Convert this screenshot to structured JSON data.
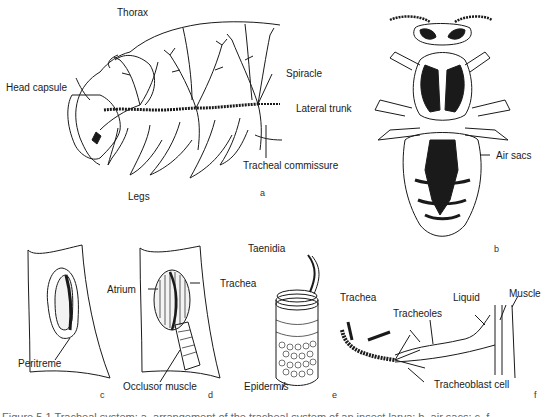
{
  "figure": {
    "panels": [
      {
        "id": "a",
        "letter": "a",
        "subject": "insect larva tracheal system (lateral view)",
        "labels": {
          "thorax": "Thorax",
          "head_capsule": "Head capsule",
          "spiracle": "Spiracle",
          "lateral_trunk": "Lateral trunk",
          "tracheal_commissure": "Tracheal commissure",
          "legs": "Legs"
        }
      },
      {
        "id": "b",
        "letter": "b",
        "subject": "adult insect dorsal view with air sacs",
        "labels": {
          "air_sacs": "Air sacs"
        }
      },
      {
        "id": "c",
        "letter": "c",
        "subject": "spiracle, external view",
        "labels": {
          "peritreme": "Peritreme"
        }
      },
      {
        "id": "d",
        "letter": "d",
        "subject": "spiracle, cutaway view",
        "labels": {
          "atrium": "Atrium",
          "trachea": "Trachea",
          "occlusor_muscle": "Occlusor muscle"
        }
      },
      {
        "id": "e",
        "letter": "e",
        "subject": "tracheal tube structure",
        "labels": {
          "taenidia": "Taenidia",
          "epidermis": "Epidermis"
        }
      },
      {
        "id": "f",
        "letter": "f",
        "subject": "tracheole endings in muscle",
        "labels": {
          "trachea": "Trachea",
          "tracheoles": "Tracheoles",
          "liquid": "Liquid",
          "muscle": "Muscle",
          "tracheoblast_cell": "Tracheoblast cell"
        }
      }
    ],
    "caption": "Figure 5.1 Tracheal system: a, arrangement of the tracheal system of an insect larva; b, air sacs; c–f ..."
  },
  "colors": {
    "ink": "#1a1a1a",
    "background": "#ffffff",
    "caption": "#666666"
  }
}
